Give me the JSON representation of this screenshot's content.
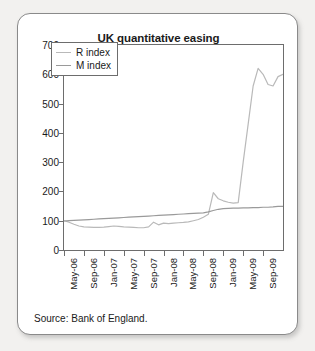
{
  "chart_data": {
    "type": "line",
    "title": "UK quantitative easing",
    "xlabel": "",
    "ylabel": "",
    "ylim": [
      0,
      700
    ],
    "ytick_values": [
      0,
      100,
      200,
      300,
      400,
      500,
      600,
      700
    ],
    "grid": false,
    "legend_position": "top-left",
    "source": "Source: Bank of England.",
    "x_tick_labels": [
      "May-06",
      "Sep-06",
      "Jan-07",
      "May-07",
      "Sep-07",
      "Jan-08",
      "May-08",
      "Sep-08",
      "Jan-09",
      "May-09",
      "Sep-09"
    ],
    "x_months": [
      "May-06",
      "Jun-06",
      "Jul-06",
      "Aug-06",
      "Sep-06",
      "Oct-06",
      "Nov-06",
      "Dec-06",
      "Jan-07",
      "Feb-07",
      "Mar-07",
      "Apr-07",
      "May-07",
      "Jun-07",
      "Jul-07",
      "Aug-07",
      "Sep-07",
      "Oct-07",
      "Nov-07",
      "Dec-07",
      "Jan-08",
      "Feb-08",
      "Mar-08",
      "Apr-08",
      "May-08",
      "Jun-08",
      "Jul-08",
      "Aug-08",
      "Sep-08",
      "Oct-08",
      "Nov-08",
      "Dec-08",
      "Jan-09",
      "Feb-09",
      "Mar-09",
      "Apr-09",
      "May-09",
      "Jun-09",
      "Jul-09",
      "Aug-09",
      "Sep-09",
      "Oct-09",
      "Nov-09",
      "Dec-09",
      "Jan-10"
    ],
    "series": [
      {
        "name": "R index",
        "color": "#b9b9b9",
        "values": [
          100,
          95,
          88,
          82,
          79,
          78,
          77,
          77,
          78,
          80,
          82,
          81,
          79,
          78,
          77,
          76,
          76,
          79,
          95,
          86,
          92,
          90,
          92,
          93,
          94,
          96,
          100,
          104,
          112,
          122,
          196,
          175,
          168,
          163,
          160,
          162,
          300,
          430,
          560,
          620,
          600,
          565,
          560,
          592,
          600
        ]
      },
      {
        "name": "M index",
        "color": "#9a9a9a",
        "values": [
          99,
          100,
          101,
          102,
          103,
          104,
          105,
          106,
          107,
          108,
          109,
          110,
          111,
          112,
          113,
          114,
          115,
          116,
          117,
          118,
          119,
          120,
          121,
          122,
          123,
          124,
          125,
          126,
          127,
          130,
          135,
          139,
          141,
          142,
          143,
          143,
          144,
          144,
          145,
          145,
          146,
          146,
          147,
          149,
          149
        ]
      }
    ]
  },
  "legend": {
    "items": [
      {
        "label": "R index"
      },
      {
        "label": "M index"
      }
    ]
  }
}
